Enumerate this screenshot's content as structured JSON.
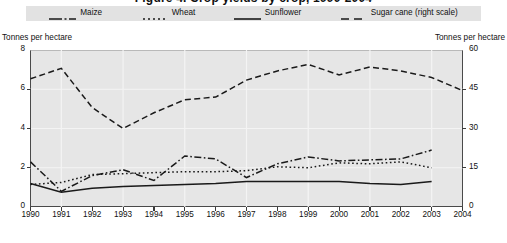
{
  "title": "Figure 4. Crop yields by crop, 1990-2004",
  "legend": {
    "items": [
      {
        "label": "Maize",
        "style": "dash-dot",
        "name": "legend-item-maize"
      },
      {
        "label": "Wheat",
        "style": "dotted",
        "name": "legend-item-wheat"
      },
      {
        "label": "Sunflower",
        "style": "solid",
        "name": "legend-item-sunflower"
      },
      {
        "label": "Sugar cane (right scale)",
        "style": "long-dash",
        "name": "legend-item-sugar-cane"
      }
    ],
    "background_color": "#e2e2e2"
  },
  "axes": {
    "left_caption": "Tonnes per hectare",
    "right_caption": "Tonnes per hectare",
    "left_ticks": [
      "0",
      "2",
      "4",
      "6",
      "8"
    ],
    "right_ticks": [
      "0",
      "15",
      "30",
      "45",
      "60"
    ],
    "x_ticks": [
      "1990",
      "1991",
      "1992",
      "1993",
      "1994",
      "1995",
      "1996",
      "1997",
      "1998",
      "1999",
      "2000",
      "2001",
      "2002",
      "2003",
      "2004"
    ]
  },
  "colors": {
    "plot_background": "#e6e6e6",
    "gridline": "#f4f4f4",
    "axis_line": "#4a4a4a",
    "series_line": "#1a1a1a",
    "page_background": "#ffffff"
  },
  "chart_data": {
    "type": "line",
    "title": "Figure 4. Crop yields by crop, 1990-2004",
    "xlabel": "",
    "ylabel": "Tonnes per hectare",
    "y2label": "Tonnes per hectare",
    "ylim": [
      0,
      8
    ],
    "y2lim": [
      0,
      60
    ],
    "xlim": [
      1990,
      2004
    ],
    "grid": true,
    "legend_position": "top",
    "x": [
      1990,
      1991,
      1992,
      1993,
      1994,
      1995,
      1996,
      1997,
      1998,
      1999,
      2000,
      2001,
      2002,
      2003,
      2004
    ],
    "series": [
      {
        "name": "Maize",
        "axis": "left",
        "style": "dash-dot",
        "values": [
          2.3,
          0.8,
          1.6,
          1.9,
          1.35,
          2.6,
          2.45,
          1.5,
          2.2,
          2.55,
          2.35,
          2.4,
          2.45,
          2.9,
          null
        ]
      },
      {
        "name": "Wheat",
        "axis": "left",
        "style": "dotted",
        "values": [
          1.15,
          1.25,
          1.65,
          1.7,
          1.75,
          1.8,
          1.8,
          1.85,
          2.05,
          2.0,
          2.25,
          2.2,
          2.3,
          2.0,
          null
        ]
      },
      {
        "name": "Sunflower",
        "axis": "left",
        "style": "solid",
        "values": [
          1.2,
          0.75,
          0.95,
          1.05,
          1.1,
          1.15,
          1.2,
          1.3,
          1.3,
          1.3,
          1.3,
          1.2,
          1.15,
          1.3,
          null
        ]
      },
      {
        "name": "Sugar cane (right scale)",
        "axis": "right",
        "style": "long-dash",
        "values": [
          49.0,
          53.0,
          38.0,
          30.0,
          36.0,
          41.0,
          42.0,
          48.5,
          52.0,
          54.5,
          50.5,
          53.5,
          52.0,
          49.5,
          44.5
        ]
      }
    ]
  }
}
